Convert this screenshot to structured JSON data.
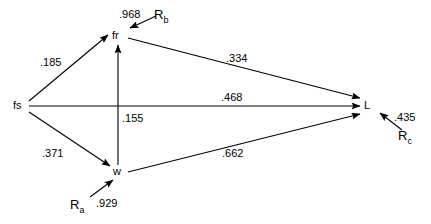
{
  "diagram": {
    "type": "path-diagram",
    "nodes": [
      {
        "id": "fs",
        "label": "fs",
        "x": 18,
        "y": 106
      },
      {
        "id": "fr",
        "label": "fr",
        "x": 117,
        "y": 36
      },
      {
        "id": "w",
        "label": "w",
        "x": 118,
        "y": 171
      },
      {
        "id": "L",
        "label": "L",
        "x": 367,
        "y": 105
      },
      {
        "id": "Ra",
        "label": "R",
        "sub": "a",
        "x": 77,
        "y": 205
      },
      {
        "id": "Rb",
        "label": "R",
        "sub": "b",
        "x": 161,
        "y": 15
      },
      {
        "id": "Rc",
        "label": "R",
        "sub": "c",
        "x": 405,
        "y": 136
      }
    ],
    "edges": [
      {
        "id": "fs-fr",
        "from": "fs",
        "to": "fr",
        "coefficient": ".185",
        "label_x": 40,
        "label_y": 57
      },
      {
        "id": "fs-w",
        "from": "fs",
        "to": "w",
        "coefficient": ".371",
        "label_x": 42,
        "label_y": 148
      },
      {
        "id": "fs-L",
        "from": "fs",
        "to": "L",
        "coefficient": ".468",
        "label_x": 221,
        "label_y": 92
      },
      {
        "id": "fr-L",
        "from": "fr",
        "to": "L",
        "coefficient": ".334",
        "label_x": 226,
        "label_y": 53
      },
      {
        "id": "w-L",
        "from": "w",
        "to": "L",
        "coefficient": ".662",
        "label_x": 222,
        "label_y": 148
      },
      {
        "id": "w-fr",
        "from": "w",
        "to": "fr",
        "coefficient": ".155",
        "label_x": 122,
        "label_y": 113
      },
      {
        "id": "Ra-w",
        "from": "Ra",
        "to": "w",
        "coefficient": ".929",
        "label_x": 96,
        "label_y": 198
      },
      {
        "id": "Rb-fr",
        "from": "Rb",
        "to": "fr",
        "coefficient": ".968",
        "label_x": 119,
        "label_y": 9
      },
      {
        "id": "Rc-L",
        "from": "Rc",
        "to": "L",
        "coefficient": ".435",
        "label_x": 394,
        "label_y": 112
      }
    ],
    "stroke_color": "#000000",
    "background_color": "#ffffff"
  }
}
